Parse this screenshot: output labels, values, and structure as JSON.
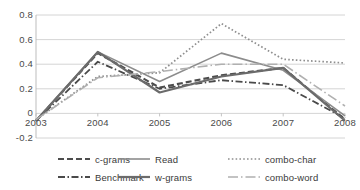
{
  "chart_data": {
    "type": "line",
    "title": "",
    "subtitle": "",
    "xlabel": "",
    "ylabel": "",
    "categories": [
      "2003",
      "2004",
      "2005",
      "2006",
      "2007",
      "2008"
    ],
    "x": [
      2003,
      2004,
      2005,
      2006,
      2007,
      2008
    ],
    "ylim": [
      -0.2,
      0.8
    ],
    "yticks": [
      0.8,
      0.6,
      0.4,
      0.2,
      0,
      -0.2
    ],
    "ytick_labels": [
      "0.8",
      "0.6",
      "0.4",
      "0.2",
      "0",
      "-0.2"
    ],
    "grid": true,
    "grid_axis": "y",
    "legend_position": "bottom",
    "legend_columns": 3,
    "series": [
      {
        "name": "c-grams",
        "values": [
          -0.06,
          0.49,
          0.21,
          0.31,
          0.37,
          -0.05
        ],
        "color": "#4d4d4d",
        "style": "dashed",
        "dasharray": "6,3",
        "width": 2.1
      },
      {
        "name": "Read",
        "values": [
          -0.06,
          0.5,
          0.26,
          0.49,
          0.35,
          -0.02
        ],
        "color": "#8c8c8c",
        "style": "solid",
        "dasharray": "none",
        "width": 1.6
      },
      {
        "name": "combo-char",
        "values": [
          -0.05,
          0.3,
          0.33,
          0.73,
          0.44,
          0.41
        ],
        "color": "#8f8f8f",
        "style": "dotted",
        "dasharray": "1.6,2.2",
        "width": 1.7
      },
      {
        "name": "Benchmark",
        "values": [
          -0.06,
          0.42,
          0.2,
          0.27,
          0.23,
          -0.04
        ],
        "color": "#4a4a4a",
        "style": "dash-dot",
        "dasharray": "7,2.5,1.5,2.5",
        "width": 1.8
      },
      {
        "name": "w-grams",
        "values": [
          -0.06,
          0.5,
          0.17,
          0.3,
          0.37,
          -0.06
        ],
        "color": "#6b6b6b",
        "style": "solid",
        "dasharray": "none",
        "width": 2.2
      },
      {
        "name": "combo-word",
        "values": [
          -0.05,
          0.29,
          0.34,
          0.4,
          0.4,
          0.06
        ],
        "color": "#b0b0b0",
        "style": "long-dash-dot",
        "dasharray": "10,3,1.5,3",
        "width": 1.6
      }
    ],
    "axis_colors": {
      "grid": "#c9c9c9",
      "axis": "#b5b5b5",
      "text": "#4a4a4a"
    }
  },
  "legend": {
    "rows": [
      [
        {
          "label": "c-grams"
        },
        {
          "label": "Read"
        },
        {
          "label": "combo-char"
        }
      ],
      [
        {
          "label": "Benchmark"
        },
        {
          "label": "w-grams"
        },
        {
          "label": "combo-word"
        }
      ]
    ]
  }
}
